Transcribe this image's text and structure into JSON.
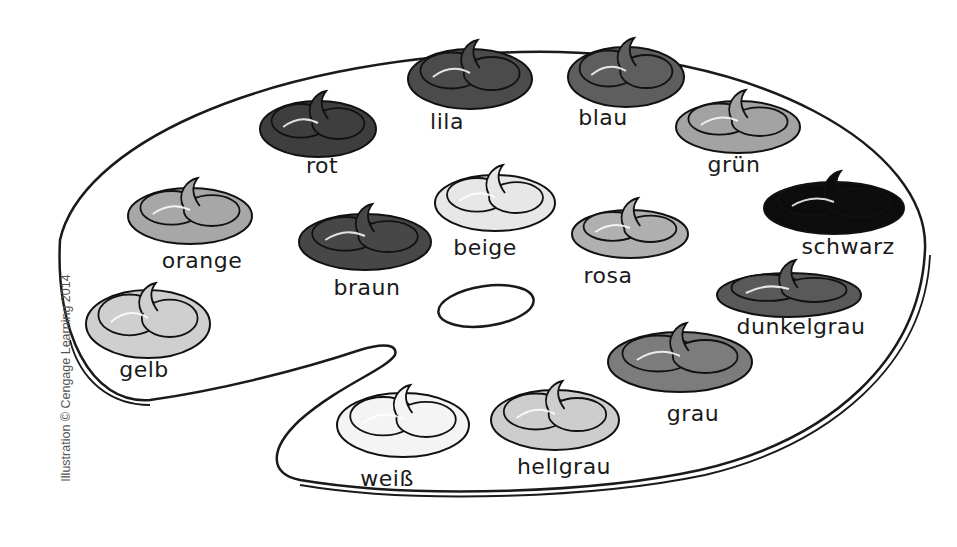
{
  "credit": "Illustration © Cengage Learning 2014",
  "palette": {
    "colors": [
      {
        "label": "rot",
        "fill": "#3e3e3e",
        "blob": {
          "cx": 318,
          "cy": 125,
          "rx": 58,
          "ry": 28
        },
        "text": {
          "x": 322,
          "y": 165
        }
      },
      {
        "label": "lila",
        "fill": "#4b4b4b",
        "blob": {
          "cx": 470,
          "cy": 75,
          "rx": 62,
          "ry": 30
        },
        "text": {
          "x": 447,
          "y": 121
        }
      },
      {
        "label": "blau",
        "fill": "#5e5e5e",
        "blob": {
          "cx": 626,
          "cy": 73,
          "rx": 58,
          "ry": 30
        },
        "text": {
          "x": 603,
          "y": 117
        }
      },
      {
        "label": "grün",
        "fill": "#a3a3a3",
        "blob": {
          "cx": 738,
          "cy": 123,
          "rx": 62,
          "ry": 26
        },
        "text": {
          "x": 734,
          "y": 164
        }
      },
      {
        "label": "schwarz",
        "fill": "#0c0c0c",
        "blob": {
          "cx": 834,
          "cy": 204,
          "rx": 70,
          "ry": 26
        },
        "text": {
          "x": 848,
          "y": 246
        }
      },
      {
        "label": "dunkelgrau",
        "fill": "#595959",
        "blob": {
          "cx": 789,
          "cy": 291,
          "rx": 72,
          "ry": 22
        },
        "text": {
          "x": 801,
          "y": 326
        }
      },
      {
        "label": "orange",
        "fill": "#a7a7a7",
        "blob": {
          "cx": 190,
          "cy": 212,
          "rx": 62,
          "ry": 28
        },
        "text": {
          "x": 202,
          "y": 260
        }
      },
      {
        "label": "braun",
        "fill": "#474747",
        "blob": {
          "cx": 365,
          "cy": 238,
          "rx": 66,
          "ry": 28
        },
        "text": {
          "x": 367,
          "y": 287
        }
      },
      {
        "label": "beige",
        "fill": "#e7e7e7",
        "blob": {
          "cx": 495,
          "cy": 199,
          "rx": 60,
          "ry": 28
        },
        "text": {
          "x": 485,
          "y": 247
        }
      },
      {
        "label": "rosa",
        "fill": "#b0b0b0",
        "blob": {
          "cx": 630,
          "cy": 230,
          "rx": 58,
          "ry": 24
        },
        "text": {
          "x": 608,
          "y": 275
        }
      },
      {
        "label": "gelb",
        "fill": "#cfcfcf",
        "blob": {
          "cx": 148,
          "cy": 320,
          "rx": 62,
          "ry": 34
        },
        "text": {
          "x": 144,
          "y": 369
        }
      },
      {
        "label": "grau",
        "fill": "#7c7c7c",
        "blob": {
          "cx": 680,
          "cy": 358,
          "rx": 72,
          "ry": 30
        },
        "text": {
          "x": 693,
          "y": 413
        }
      },
      {
        "label": "weiß",
        "fill": "#f4f4f4",
        "blob": {
          "cx": 403,
          "cy": 421,
          "rx": 66,
          "ry": 32
        },
        "text": {
          "x": 387,
          "y": 478
        }
      },
      {
        "label": "hellgrau",
        "fill": "#cdcdcd",
        "blob": {
          "cx": 555,
          "cy": 416,
          "rx": 64,
          "ry": 30
        },
        "text": {
          "x": 564,
          "y": 466
        }
      }
    ]
  }
}
